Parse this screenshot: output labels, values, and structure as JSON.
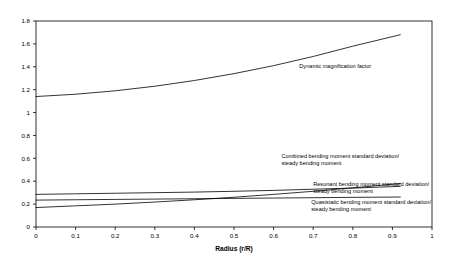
{
  "chart_data": {
    "type": "line",
    "title": "",
    "xlabel": "Radius (r/R)",
    "ylabel": "",
    "xlim": [
      0,
      1
    ],
    "ylim": [
      0,
      1.8
    ],
    "grid": false,
    "legend_position": "inline-annotations",
    "xticks": [
      "0",
      "0.1",
      "0.2",
      "0.3",
      "0.4",
      "0.5",
      "0.6",
      "0.7",
      "0.8",
      "0.9",
      "1"
    ],
    "yticks": [
      "0",
      "0.2",
      "0.4",
      "0.6",
      "0.8",
      "1",
      "1.2",
      "1.4",
      "1.6",
      "1.8"
    ],
    "series": [
      {
        "name": "Dynamic magnification factor",
        "x": [
          0.0,
          0.1,
          0.2,
          0.3,
          0.4,
          0.5,
          0.6,
          0.7,
          0.8,
          0.92
        ],
        "values": [
          1.14,
          1.16,
          1.19,
          1.23,
          1.28,
          1.34,
          1.41,
          1.49,
          1.58,
          1.68
        ]
      },
      {
        "name": "Combined bending moment standard deviation/ steady bending moment",
        "x": [
          0.0,
          0.1,
          0.2,
          0.3,
          0.4,
          0.5,
          0.6,
          0.7,
          0.8,
          0.92
        ],
        "values": [
          0.17,
          0.185,
          0.2,
          0.218,
          0.238,
          0.26,
          0.285,
          0.312,
          0.342,
          0.38
        ]
      },
      {
        "name": "Resonant bending moment standard deviation/ steady bending moment",
        "x": [
          0.0,
          0.1,
          0.2,
          0.3,
          0.4,
          0.5,
          0.6,
          0.7,
          0.8,
          0.92
        ],
        "values": [
          0.285,
          0.29,
          0.295,
          0.3,
          0.305,
          0.312,
          0.32,
          0.33,
          0.34,
          0.355
        ]
      },
      {
        "name": "Quasistatic bending moment standard deviation/ steady bending moment",
        "x": [
          0.0,
          0.1,
          0.2,
          0.3,
          0.4,
          0.5,
          0.6,
          0.7,
          0.8,
          0.92
        ],
        "values": [
          0.235,
          0.238,
          0.241,
          0.244,
          0.247,
          0.25,
          0.253,
          0.256,
          0.259,
          0.262
        ]
      }
    ],
    "annotations": [
      {
        "id": "dynamic-magnification-factor",
        "lines": [
          "Dynamic magnification factor"
        ],
        "x": 0.665,
        "y": 1.39
      },
      {
        "id": "combined-bending-moment",
        "lines": [
          "Combined bending moment standard deviation/",
          "steady bending moment"
        ],
        "x": 0.62,
        "y": 0.6
      },
      {
        "id": "resonant-bending-moment",
        "lines": [
          "Resonant bending moment standard deviation/",
          "steady bending moment"
        ],
        "x": 0.7,
        "y": 0.355
      },
      {
        "id": "quasistatic-bending-moment",
        "lines": [
          "Quasistatic bending moment standard deviation/",
          "steady bending moment"
        ],
        "x": 0.695,
        "y": 0.2
      }
    ],
    "colors": {
      "line": "#000000",
      "axis": "#000000",
      "background": "#ffffff",
      "text": "#000000"
    }
  }
}
